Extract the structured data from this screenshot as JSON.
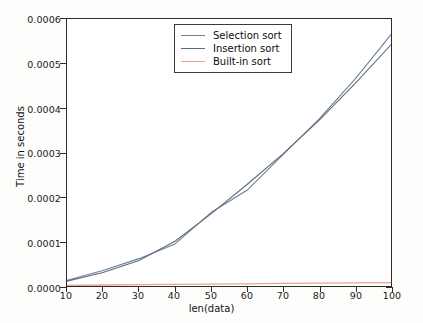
{
  "chart_data": {
    "type": "line",
    "title": "",
    "xlabel": "len(data)",
    "ylabel": "Time in seconds",
    "xlim": [
      10,
      100
    ],
    "ylim": [
      0.0,
      0.0006
    ],
    "grid": false,
    "legend_position": "upper center",
    "x": [
      10,
      20,
      30,
      40,
      50,
      60,
      70,
      80,
      90,
      100
    ],
    "xticks": [
      "10",
      "20",
      "30",
      "40",
      "50",
      "60",
      "70",
      "80",
      "90",
      "100"
    ],
    "yticks": [
      "0.0000",
      "0.0001",
      "0.0002",
      "0.0003",
      "0.0004",
      "0.0005",
      "0.0006"
    ],
    "ytick_values": [
      0.0,
      0.0001,
      0.0002,
      0.0003,
      0.0004,
      0.0005,
      0.0006
    ],
    "series": [
      {
        "name": "Selection sort",
        "color": "#6e7f95",
        "values": [
          1.3e-05,
          3.5e-05,
          6.15e-05,
          9.45e-05,
          0.000165,
          0.000215,
          0.000295,
          0.000375,
          0.000465,
          0.000565
        ]
      },
      {
        "name": "Insertion sort",
        "color": "#5b6b80",
        "values": [
          1.1e-05,
          3.05e-05,
          5.75e-05,
          0.0001005,
          0.000162,
          0.000228,
          0.000297,
          0.000372,
          0.000455,
          0.000542
        ]
      },
      {
        "name": "Built-in sort",
        "color": "#f0a08c",
        "values": [
          1.5e-06,
          2.2e-06,
          2.9e-06,
          3.6e-06,
          4.3e-06,
          5e-06,
          5.7e-06,
          6.4e-06,
          7.1e-06,
          7.8e-06
        ]
      }
    ]
  },
  "legend": {
    "items": [
      {
        "label": "Selection sort"
      },
      {
        "label": "Insertion sort"
      },
      {
        "label": "Built-in sort"
      }
    ]
  },
  "axes": {
    "x_title": "len(data)",
    "y_title": "Time in seconds"
  }
}
